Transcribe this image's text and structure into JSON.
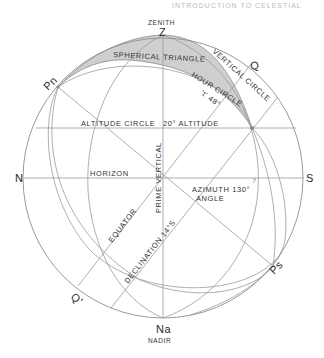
{
  "header": {
    "running_title": "INTRODUCTION TO CELESTIAL"
  },
  "diagram": {
    "points": {
      "zenith_letter": "Z",
      "zenith_label": "ZENITH",
      "nadir_letter": "Na",
      "nadir_label": "NADIR",
      "north": "N",
      "south": "S",
      "north_pole": "Pn",
      "south_pole": "Ps",
      "equator_top": "Q",
      "equator_bottom": "Q'"
    },
    "labels": {
      "spherical_triangle": "SPHERICAL TRIANGLE",
      "vertical_circle": "VERTICAL CIRCLE",
      "hour_circle": "HOUR CIRCLE",
      "hour_angle": "'t' 48°",
      "altitude_circle": "ALTITUDE CIRCLE",
      "altitude_value": "20° ALTITUDE",
      "horizon": "HORIZON",
      "prime_vertical": "PRIME VERTICAL",
      "azimuth_angle_line1": "AZIMUTH 130°",
      "azimuth_angle_line2": "ANGLE",
      "equator": "EQUATOR",
      "declination": "DECLINATION 14°S"
    },
    "values": {
      "hour_angle_deg": 48,
      "altitude_deg": 20,
      "azimuth_deg": 130,
      "declination_deg": 14,
      "declination_dir": "S"
    },
    "colors": {
      "line": "#9a9a9a",
      "triangle_fill": "#cfcfcf",
      "text": "#333333"
    }
  }
}
